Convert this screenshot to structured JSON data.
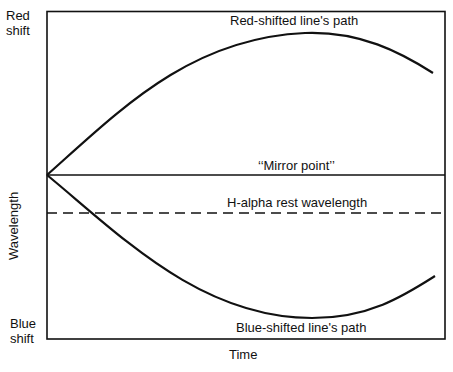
{
  "diagram": {
    "axis_top_label_line1": "Red",
    "axis_top_label_line2": "shift",
    "axis_bottom_label_line1": "Blue",
    "axis_bottom_label_line2": "shift",
    "y_axis_label": "Wavelength",
    "x_axis_label": "Time",
    "red_curve_label": "Red-shifted line's path",
    "blue_curve_label": "Blue-shifted line's path",
    "mirror_label": "‘‘Mirror point’’",
    "rest_label": "H-alpha rest wavelength",
    "line_color": "#111111"
  }
}
